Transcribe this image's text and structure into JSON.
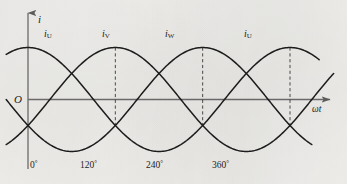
{
  "figure": {
    "background_color": "#f2f1ee",
    "ink_color": "#1d1d1d",
    "axis_color": "#6f6f6f",
    "width": 347,
    "height": 184
  },
  "axes": {
    "y_label": "i",
    "x_label": "ωt",
    "origin_label": "O"
  },
  "curve_labels": [
    {
      "base": "i",
      "sub": "U"
    },
    {
      "base": "i",
      "sub": "V"
    },
    {
      "base": "i",
      "sub": "W"
    },
    {
      "base": "i",
      "sub": "U"
    }
  ],
  "tick_labels": [
    {
      "value": "0",
      "unit": "°"
    },
    {
      "value": "120",
      "unit": "°"
    },
    {
      "value": "240",
      "unit": "°"
    },
    {
      "value": "360",
      "unit": "°"
    }
  ],
  "chart_data": {
    "type": "line",
    "title": "",
    "subtitle": "",
    "xlabel": "ωt",
    "ylabel": "i",
    "grid": false,
    "legend_position": "inline-above-peaks",
    "xlim": [
      -30,
      420
    ],
    "ylim": [
      -1.15,
      1.15
    ],
    "x_tick_values": [
      0,
      120,
      240,
      360
    ],
    "x_tick_labels": [
      "0°",
      "120°",
      "240°",
      "360°"
    ],
    "y_tick_values": [],
    "y_tick_labels": [],
    "dashed_verticals": [
      120,
      240,
      360
    ],
    "amplitude": 1,
    "x_start": -30,
    "x_end": 420,
    "x_step": 2,
    "series": [
      {
        "name": "iU",
        "phase_deg": 90,
        "label": "i_U",
        "label_x_deg": 40,
        "description": "sin(wt + 90) = cosine, peaks at 0 and 360",
        "x_from": -30,
        "x_to": 400
      },
      {
        "name": "iV",
        "phase_deg": -30,
        "label": "i_V",
        "label_x_deg": 150,
        "description": "sin(wt - 30), peaks at 120",
        "x_from": -30,
        "x_to": 420
      },
      {
        "name": "iW",
        "phase_deg": -150,
        "label": "i_W",
        "label_x_deg": 262,
        "description": "sin(wt - 150), peaks at 240",
        "x_from": -30,
        "x_to": 390
      }
    ],
    "annotations": [
      {
        "text": "i_U",
        "x_deg": 40,
        "y": 1.05
      },
      {
        "text": "i_V",
        "x_deg": 150,
        "y": 1.05
      },
      {
        "text": "i_W",
        "x_deg": 262,
        "y": 1.05
      },
      {
        "text": "i_U",
        "x_deg": 372,
        "y": 1.05
      }
    ]
  },
  "layout": {
    "origin_px": {
      "x": 28,
      "y": 99.5
    },
    "px_per_degree": 0.7278,
    "amplitude_px": 52,
    "y_axis_top_px": 13,
    "y_axis_bottom_px": 169,
    "x_axis_right_px": 330,
    "curve_label_y_px": 30,
    "curve_label_x_px": [
      48,
      105,
      168,
      246
    ],
    "tick_label_y_px": 163,
    "tick_label_x_px": [
      30,
      82,
      148,
      214
    ]
  }
}
